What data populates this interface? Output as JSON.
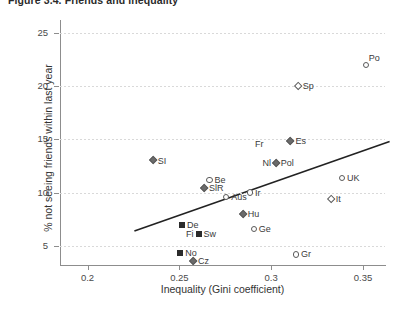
{
  "figure": {
    "title": "Figure 3.4. Friends and inequality"
  },
  "chart_data": {
    "type": "scatter",
    "title": "Figure 3.4. Friends and inequality",
    "xlabel": "Inequality (Gini coefficient)",
    "ylabel": "% not seeing friends within last year",
    "xlim": [
      0.185,
      0.362
    ],
    "ylim": [
      3.2,
      26.2
    ],
    "xticks": [
      0.2,
      0.25,
      0.3,
      0.35
    ],
    "xtick_labels": [
      "0.2",
      "0.25",
      "0.3",
      "0.35"
    ],
    "yticks": [
      5,
      10,
      15,
      20,
      25
    ],
    "ytick_labels": [
      "5",
      "10",
      "15",
      "20",
      "25"
    ],
    "grid": "horizontal-dotted",
    "legend": "none",
    "trendline": {
      "type": "linear",
      "x_start": 0.2255,
      "y_start": 6.4,
      "x_end": 0.3645,
      "y_end": 14.8
    },
    "points": [
      {
        "label": "SI",
        "x": 0.2355,
        "y": 13.0,
        "marker": "diamond-fill",
        "label_pos": "r"
      },
      {
        "label": "Be",
        "x": 0.2665,
        "y": 11.2,
        "marker": "circle-open",
        "label_pos": "r"
      },
      {
        "label": "SlR",
        "x": 0.2635,
        "y": 10.4,
        "marker": "diamond-fill",
        "label_pos": "r"
      },
      {
        "label": "Aus",
        "x": 0.2755,
        "y": 9.6,
        "marker": "circle-open",
        "label_pos": "r"
      },
      {
        "label": "Hu",
        "x": 0.2845,
        "y": 8.0,
        "marker": "diamond-fill",
        "label_pos": "r"
      },
      {
        "label": "De",
        "x": 0.2515,
        "y": 7.0,
        "marker": "square-fill",
        "label_pos": "r"
      },
      {
        "label": "Sw",
        "x": 0.2605,
        "y": 6.1,
        "marker": "square-fill",
        "label_pos": "r"
      },
      {
        "label": "Fi",
        "x": 0.2605,
        "y": 6.1,
        "marker": "none",
        "label_pos": "l"
      },
      {
        "label": "No",
        "x": 0.2505,
        "y": 4.3,
        "marker": "square-fill",
        "label_pos": "r"
      },
      {
        "label": "Cz",
        "x": 0.2575,
        "y": 3.6,
        "marker": "diamond-fill",
        "label_pos": "r"
      },
      {
        "label": "Ge",
        "x": 0.2905,
        "y": 6.6,
        "marker": "circle-open",
        "label_pos": "r"
      },
      {
        "label": "Gr",
        "x": 0.3135,
        "y": 4.2,
        "marker": "circle-open",
        "label_pos": "r"
      },
      {
        "label": "Ir",
        "x": 0.2885,
        "y": 10.0,
        "marker": "circle-open",
        "label_pos": "r"
      },
      {
        "label": "Nl",
        "x": 0.2925,
        "y": 12.8,
        "marker": "none",
        "label_pos": "r"
      },
      {
        "label": "Pol",
        "x": 0.3025,
        "y": 12.8,
        "marker": "diamond-fill",
        "label_pos": "r"
      },
      {
        "label": "Fr",
        "x": 0.2885,
        "y": 14.6,
        "marker": "none",
        "label_pos": "r"
      },
      {
        "label": "Es",
        "x": 0.3105,
        "y": 14.8,
        "marker": "diamond-fill",
        "label_pos": "r"
      },
      {
        "label": "UK",
        "x": 0.3385,
        "y": 11.4,
        "marker": "circle-open",
        "label_pos": "r"
      },
      {
        "label": "It",
        "x": 0.3325,
        "y": 9.4,
        "marker": "diamond-open",
        "label_pos": "r"
      },
      {
        "label": "Sp",
        "x": 0.3145,
        "y": 20.0,
        "marker": "diamond-open",
        "label_pos": "r"
      },
      {
        "label": "Po",
        "x": 0.3515,
        "y": 22.0,
        "marker": "circle-open",
        "label_pos": "tr"
      }
    ]
  }
}
